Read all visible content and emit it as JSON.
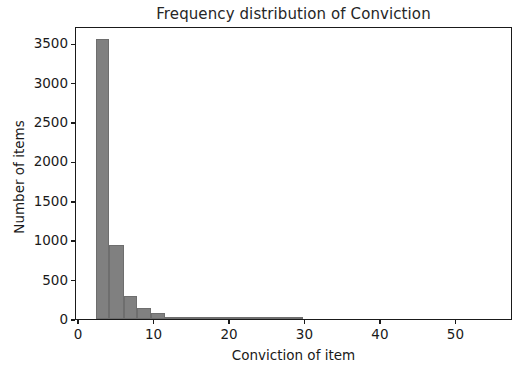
{
  "chart_data": {
    "type": "bar",
    "subtype": "histogram",
    "title": "Frequency distribution of Conviction",
    "xlabel": "Conviction of item",
    "ylabel": "Number of items",
    "xlim": [
      -0.4,
      57.5
    ],
    "ylim": [
      0,
      3720
    ],
    "xticks": [
      0,
      10,
      20,
      30,
      40,
      50
    ],
    "xtick_labels": [
      "0",
      "10",
      "20",
      "30",
      "40",
      "50"
    ],
    "yticks": [
      0,
      500,
      1000,
      1500,
      2000,
      2500,
      3000,
      3500
    ],
    "ytick_labels": [
      "0",
      "500",
      "1000",
      "1500",
      "2000",
      "2500",
      "3000",
      "3500"
    ],
    "grid": false,
    "legend": null,
    "bar_color": "#808080",
    "bar_edge_color": "#6e6e6e",
    "axes_color": "#1a1a1a",
    "background": "#ffffff",
    "bin_edges": [
      2.2,
      4.0,
      5.9,
      7.7,
      9.5,
      11.4,
      13.2,
      15.0,
      16.9,
      18.7,
      20.5,
      22.4,
      24.2,
      26.0,
      27.9,
      29.7
    ],
    "bins": [
      {
        "x0": 2.2,
        "x1": 4.0,
        "count": 3560
      },
      {
        "x0": 4.0,
        "x1": 5.9,
        "count": 945
      },
      {
        "x0": 5.9,
        "x1": 7.7,
        "count": 295
      },
      {
        "x0": 7.7,
        "x1": 9.5,
        "count": 140
      },
      {
        "x0": 9.5,
        "x1": 11.4,
        "count": 75
      },
      {
        "x0": 11.4,
        "x1": 13.2,
        "count": 16
      },
      {
        "x0": 13.2,
        "x1": 15.0,
        "count": 22
      },
      {
        "x0": 15.0,
        "x1": 16.9,
        "count": 6
      },
      {
        "x0": 16.9,
        "x1": 18.7,
        "count": 10
      },
      {
        "x0": 18.7,
        "x1": 20.5,
        "count": 3
      },
      {
        "x0": 20.5,
        "x1": 22.4,
        "count": 2
      },
      {
        "x0": 22.4,
        "x1": 24.2,
        "count": 1
      },
      {
        "x0": 24.2,
        "x1": 26.0,
        "count": 1
      },
      {
        "x0": 26.0,
        "x1": 27.9,
        "count": 1
      },
      {
        "x0": 27.9,
        "x1": 29.7,
        "count": 1
      }
    ]
  }
}
